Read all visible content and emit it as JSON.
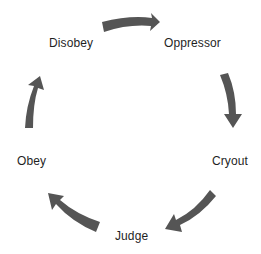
{
  "diagram": {
    "type": "cycle",
    "colors": {
      "arrow": "#555555",
      "text": "#1f1f1f",
      "background": "#ffffff"
    },
    "nodes": [
      {
        "id": "disobey",
        "label": "Disobey"
      },
      {
        "id": "oppressor",
        "label": "Oppressor"
      },
      {
        "id": "cryout",
        "label": "Cryout"
      },
      {
        "id": "judge",
        "label": "Judge"
      },
      {
        "id": "obey",
        "label": "Obey"
      }
    ],
    "edges": [
      {
        "from": "disobey",
        "to": "oppressor"
      },
      {
        "from": "oppressor",
        "to": "cryout"
      },
      {
        "from": "cryout",
        "to": "judge"
      },
      {
        "from": "judge",
        "to": "obey"
      },
      {
        "from": "obey",
        "to": "disobey"
      }
    ]
  }
}
